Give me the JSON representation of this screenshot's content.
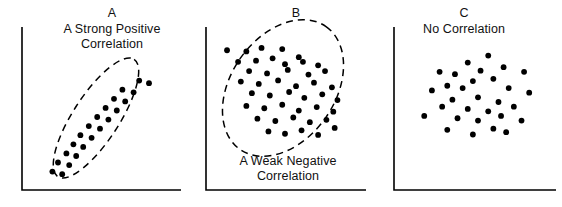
{
  "figure": {
    "width": 562,
    "height": 207,
    "background": "#ffffff",
    "ink": "#000000"
  },
  "chart_data": [
    {
      "type": "scatter",
      "id": "panel-a",
      "title": "A",
      "caption": "A Strong Positive\nCorrelation",
      "caption_position": "top",
      "xlabel": "",
      "ylabel": "",
      "xlim": [
        0,
        100
      ],
      "ylim": [
        0,
        100
      ],
      "grid": false,
      "legend": "none",
      "axes_style": "L-shaped spines, no ticks, no tick labels",
      "annotation": {
        "shape": "ellipse",
        "style": "dashed",
        "cx": 52,
        "cy": 50,
        "rx": 46,
        "ry": 15,
        "rotation_deg": -57,
        "meaning": "narrow envelope around points indicating strong positive correlation"
      },
      "points": [
        {
          "x": 16,
          "y": 8
        },
        {
          "x": 23,
          "y": 6
        },
        {
          "x": 20,
          "y": 15
        },
        {
          "x": 28,
          "y": 13
        },
        {
          "x": 26,
          "y": 22
        },
        {
          "x": 33,
          "y": 20
        },
        {
          "x": 31,
          "y": 29
        },
        {
          "x": 38,
          "y": 27
        },
        {
          "x": 36,
          "y": 36
        },
        {
          "x": 44,
          "y": 34
        },
        {
          "x": 42,
          "y": 43
        },
        {
          "x": 50,
          "y": 41
        },
        {
          "x": 48,
          "y": 50
        },
        {
          "x": 56,
          "y": 48
        },
        {
          "x": 54,
          "y": 57
        },
        {
          "x": 62,
          "y": 55
        },
        {
          "x": 60,
          "y": 64
        },
        {
          "x": 68,
          "y": 62
        },
        {
          "x": 66,
          "y": 71
        },
        {
          "x": 74,
          "y": 69
        },
        {
          "x": 78,
          "y": 78
        },
        {
          "x": 85,
          "y": 76
        }
      ]
    },
    {
      "type": "scatter",
      "id": "panel-b",
      "title": "B",
      "caption": "A Weak Negative\nCorrelation",
      "caption_position": "bottom",
      "xlabel": "",
      "ylabel": "",
      "xlim": [
        0,
        100
      ],
      "ylim": [
        0,
        100
      ],
      "grid": false,
      "legend": "none",
      "axes_style": "L-shaped spines, no ticks, no tick labels",
      "annotation": {
        "shape": "ellipse",
        "style": "dashed",
        "cx": 50,
        "cy": 55,
        "rx": 44,
        "ry": 30,
        "rotation_deg": -55,
        "meaning": "broad envelope around points indicating weak negative correlation"
      },
      "points": [
        {
          "x": 8,
          "y": 86
        },
        {
          "x": 22,
          "y": 85
        },
        {
          "x": 33,
          "y": 88
        },
        {
          "x": 48,
          "y": 87
        },
        {
          "x": 60,
          "y": 80
        },
        {
          "x": 16,
          "y": 76
        },
        {
          "x": 29,
          "y": 77
        },
        {
          "x": 41,
          "y": 79
        },
        {
          "x": 50,
          "y": 74
        },
        {
          "x": 63,
          "y": 76
        },
        {
          "x": 74,
          "y": 73
        },
        {
          "x": 24,
          "y": 68
        },
        {
          "x": 37,
          "y": 66
        },
        {
          "x": 52,
          "y": 69
        },
        {
          "x": 67,
          "y": 65
        },
        {
          "x": 79,
          "y": 68
        },
        {
          "x": 18,
          "y": 59
        },
        {
          "x": 31,
          "y": 57
        },
        {
          "x": 45,
          "y": 60
        },
        {
          "x": 58,
          "y": 55
        },
        {
          "x": 71,
          "y": 58
        },
        {
          "x": 84,
          "y": 54
        },
        {
          "x": 26,
          "y": 49
        },
        {
          "x": 39,
          "y": 47
        },
        {
          "x": 53,
          "y": 50
        },
        {
          "x": 64,
          "y": 45
        },
        {
          "x": 77,
          "y": 48
        },
        {
          "x": 88,
          "y": 43
        },
        {
          "x": 22,
          "y": 38
        },
        {
          "x": 35,
          "y": 36
        },
        {
          "x": 48,
          "y": 39
        },
        {
          "x": 60,
          "y": 34
        },
        {
          "x": 73,
          "y": 37
        },
        {
          "x": 85,
          "y": 33
        },
        {
          "x": 30,
          "y": 27
        },
        {
          "x": 43,
          "y": 25
        },
        {
          "x": 56,
          "y": 28
        },
        {
          "x": 68,
          "y": 24
        },
        {
          "x": 80,
          "y": 26
        },
        {
          "x": 38,
          "y": 16
        },
        {
          "x": 50,
          "y": 14
        },
        {
          "x": 62,
          "y": 17
        },
        {
          "x": 74,
          "y": 13
        },
        {
          "x": 86,
          "y": 19
        }
      ]
    },
    {
      "type": "scatter",
      "id": "panel-c",
      "title": "C",
      "caption": "No Correlation",
      "caption_position": "top",
      "xlabel": "",
      "ylabel": "",
      "xlim": [
        0,
        100
      ],
      "ylim": [
        0,
        100
      ],
      "grid": false,
      "legend": "none",
      "axes_style": "L-shaped spines, no ticks, no tick labels",
      "annotation": null,
      "points": [
        {
          "x": 58,
          "y": 90
        },
        {
          "x": 42,
          "y": 84
        },
        {
          "x": 70,
          "y": 80
        },
        {
          "x": 20,
          "y": 76
        },
        {
          "x": 32,
          "y": 74
        },
        {
          "x": 52,
          "y": 77
        },
        {
          "x": 86,
          "y": 76
        },
        {
          "x": 46,
          "y": 68
        },
        {
          "x": 62,
          "y": 70
        },
        {
          "x": 26,
          "y": 64
        },
        {
          "x": 38,
          "y": 62
        },
        {
          "x": 14,
          "y": 60
        },
        {
          "x": 74,
          "y": 62
        },
        {
          "x": 90,
          "y": 58
        },
        {
          "x": 30,
          "y": 52
        },
        {
          "x": 50,
          "y": 54
        },
        {
          "x": 66,
          "y": 50
        },
        {
          "x": 22,
          "y": 46
        },
        {
          "x": 42,
          "y": 44
        },
        {
          "x": 58,
          "y": 42
        },
        {
          "x": 78,
          "y": 46
        },
        {
          "x": 8,
          "y": 38
        },
        {
          "x": 34,
          "y": 36
        },
        {
          "x": 50,
          "y": 34
        },
        {
          "x": 68,
          "y": 38
        },
        {
          "x": 84,
          "y": 34
        },
        {
          "x": 26,
          "y": 26
        },
        {
          "x": 46,
          "y": 22
        },
        {
          "x": 62,
          "y": 27
        },
        {
          "x": 72,
          "y": 24
        }
      ]
    }
  ]
}
